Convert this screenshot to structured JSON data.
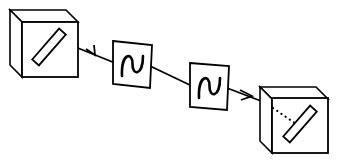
{
  "figure": {
    "title": "Optical beam path between two polarizer boxes through two wave plates",
    "kind": "optics-schematic",
    "width": 342,
    "height": 166,
    "background_color": "#ffffff",
    "line_color": "#000000",
    "stroke_width": 1.6
  },
  "components": {
    "left_box": {
      "name": "left-polarizer-box",
      "label": "",
      "projection": "oblique-cabinet",
      "front_face": {
        "x": 22,
        "y": 22,
        "width": 56,
        "height": 55
      },
      "depth_offset": {
        "dx": -12,
        "dy": -12
      },
      "slit": {
        "name": "left-polarizer-slit",
        "angle_deg": -49,
        "length": 41,
        "width": 9,
        "center": {
          "x": 49,
          "y": 47
        }
      }
    },
    "right_box": {
      "name": "right-polarizer-box",
      "label": "",
      "projection": "oblique-cabinet",
      "front_face": {
        "x": 272,
        "y": 98,
        "width": 56,
        "height": 55
      },
      "depth_offset": {
        "dx": -12,
        "dy": -12
      },
      "slit": {
        "name": "right-polarizer-slit",
        "angle_deg": -49,
        "length": 41,
        "width": 9,
        "center": {
          "x": 300,
          "y": 124
        }
      }
    },
    "wave_plate_1": {
      "name": "wave-plate-1",
      "label": "",
      "corners": "113,41 152,45 150,88 113,84",
      "squiggle_glyph": "sine-wave"
    },
    "wave_plate_2": {
      "name": "wave-plate-2",
      "label": "",
      "corners": "190,63 229,66 227,110 190,107",
      "squiggle_glyph": "sine-wave"
    }
  },
  "beam": {
    "name": "light-beam",
    "style_solid": "solid",
    "style_inside_box": "dotted",
    "segments": [
      {
        "from": {
          "x": 60,
          "y": 41
        },
        "to": {
          "x": 113,
          "y": 62
        },
        "style": "solid"
      },
      {
        "from": {
          "x": 152,
          "y": 66
        },
        "to": {
          "x": 190,
          "y": 85
        },
        "style": "solid"
      },
      {
        "from": {
          "x": 229,
          "y": 88
        },
        "to": {
          "x": 272,
          "y": 105
        },
        "style": "solid"
      },
      {
        "from": {
          "x": 272,
          "y": 105
        },
        "to": {
          "x": 300,
          "y": 124
        },
        "style": "dotted"
      }
    ],
    "arrows": [
      {
        "name": "arrow-left",
        "at": {
          "x": 94,
          "y": 54
        },
        "direction": "left"
      },
      {
        "name": "arrow-right",
        "at": {
          "x": 249,
          "y": 96
        },
        "direction": "right"
      }
    ]
  }
}
